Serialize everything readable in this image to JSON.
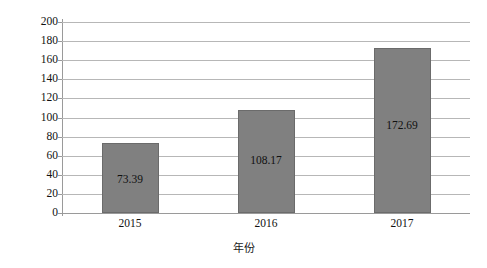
{
  "chart_data": {
    "type": "bar",
    "title": "",
    "subtitle": "",
    "categories": [
      "2015",
      "2016",
      "2017"
    ],
    "values": [
      73.39,
      108.17,
      172.69
    ],
    "data_labels": [
      "73.39",
      "108.17",
      "172.69"
    ],
    "series": [
      {
        "name": "资产总额",
        "values": [
          73.39,
          108.17,
          172.69
        ],
        "color": "#808080"
      }
    ],
    "xlabel": "年份",
    "ylabel": "资产总额 / 亿元",
    "ylim": [
      0,
      200
    ],
    "ytick_step": 20,
    "ytick_labels": [
      "200",
      "180",
      "160",
      "140",
      "120",
      "100",
      "80",
      "60",
      "40",
      "20",
      "0"
    ],
    "ytick_values": [
      200,
      180,
      160,
      140,
      120,
      100,
      80,
      60,
      40,
      20,
      0
    ],
    "grid": true,
    "grid_orientation": "horizontal",
    "legend": false,
    "legend_position": "none",
    "annotations": []
  },
  "style": {
    "bar_fill": "#808080",
    "bar_border": "#6b6b6b",
    "gridline_color": "#b7b7b7",
    "axis_color": "#9a9a9a",
    "text_color": "#111111",
    "background": "#ffffff"
  }
}
